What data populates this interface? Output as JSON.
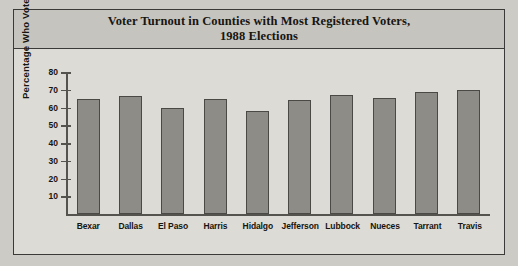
{
  "chart_data": {
    "type": "bar",
    "title": "Voter Turnout in Counties with Most Registered Voters, 1988 Elections",
    "title_line1": "Voter Turnout in Counties with Most Registered Voters,",
    "title_line2": "1988 Elections",
    "xlabel": "",
    "ylabel": "Percentage Who Voted",
    "categories": [
      "Bexar",
      "Dallas",
      "El Paso",
      "Harris",
      "Hidalgo",
      "Jefferson",
      "Lubbock",
      "Nueces",
      "Tarrant",
      "Travis"
    ],
    "values": [
      65,
      66.5,
      60,
      65,
      58,
      64.5,
      67,
      65.5,
      69,
      70
    ],
    "ylim": [
      0,
      80
    ],
    "yticks": [
      10,
      20,
      30,
      40,
      50,
      60,
      70,
      80
    ],
    "ytick_labels": [
      "10",
      "20",
      "30",
      "40",
      "50",
      "60",
      "70",
      "80"
    ],
    "grid": false,
    "legend": false,
    "bar_color": "#8e8c87",
    "bar_border_color": "#4b4945",
    "plot_background": "#dddbd6",
    "title_background": "#c6c4bf",
    "page_background": "#cdcbc6",
    "axis_color": "#55534e",
    "text_color": "#17150f"
  }
}
